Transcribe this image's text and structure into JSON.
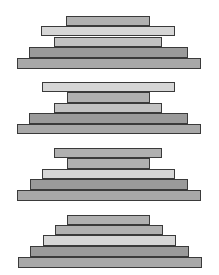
{
  "diagram": {
    "colors": {
      "light": "#d6d6d6",
      "mid_light": "#c2c2c2",
      "mid": "#b0b0b0",
      "mid_dark": "#a8a8a8",
      "dark": "#9a9a9a",
      "border": "#3a3a3a"
    },
    "groups": [
      {
        "bars": [
          {
            "x": 66,
            "y": 16,
            "w": 84,
            "h": 10,
            "shade": "mid"
          },
          {
            "x": 41,
            "y": 26,
            "w": 134,
            "h": 10,
            "shade": "light"
          },
          {
            "x": 54,
            "y": 37,
            "w": 108,
            "h": 10,
            "shade": "mid_light"
          },
          {
            "x": 29,
            "y": 47,
            "w": 159,
            "h": 11,
            "shade": "dark"
          },
          {
            "x": 17,
            "y": 58,
            "w": 184,
            "h": 11,
            "shade": "mid_dark"
          }
        ]
      },
      {
        "bars": [
          {
            "x": 42,
            "y": 82,
            "w": 133,
            "h": 10,
            "shade": "light"
          },
          {
            "x": 67,
            "y": 92,
            "w": 83,
            "h": 11,
            "shade": "mid"
          },
          {
            "x": 54,
            "y": 103,
            "w": 108,
            "h": 10,
            "shade": "mid_light"
          },
          {
            "x": 29,
            "y": 113,
            "w": 159,
            "h": 11,
            "shade": "dark"
          },
          {
            "x": 17,
            "y": 124,
            "w": 184,
            "h": 10,
            "shade": "mid_dark"
          }
        ]
      },
      {
        "bars": [
          {
            "x": 54,
            "y": 148,
            "w": 108,
            "h": 10,
            "shade": "mid"
          },
          {
            "x": 67,
            "y": 158,
            "w": 83,
            "h": 11,
            "shade": "mid"
          },
          {
            "x": 42,
            "y": 169,
            "w": 133,
            "h": 10,
            "shade": "light"
          },
          {
            "x": 30,
            "y": 179,
            "w": 158,
            "h": 11,
            "shade": "dark"
          },
          {
            "x": 17,
            "y": 190,
            "w": 184,
            "h": 11,
            "shade": "mid_dark"
          }
        ]
      },
      {
        "bars": [
          {
            "x": 67,
            "y": 215,
            "w": 83,
            "h": 10,
            "shade": "mid"
          },
          {
            "x": 55,
            "y": 225,
            "w": 108,
            "h": 10,
            "shade": "mid"
          },
          {
            "x": 43,
            "y": 235,
            "w": 133,
            "h": 11,
            "shade": "light"
          },
          {
            "x": 30,
            "y": 246,
            "w": 159,
            "h": 11,
            "shade": "dark"
          },
          {
            "x": 18,
            "y": 257,
            "w": 184,
            "h": 11,
            "shade": "mid_dark"
          }
        ]
      }
    ]
  }
}
